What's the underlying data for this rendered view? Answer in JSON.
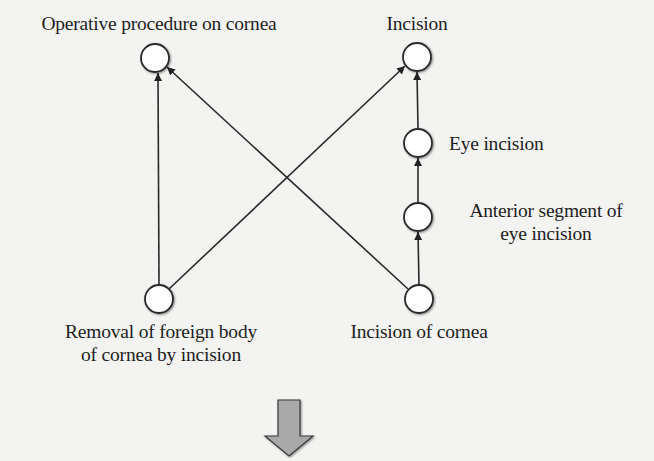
{
  "diagram": {
    "type": "directed-graph",
    "nodes": [
      {
        "id": "operative_procedure_on_cornea",
        "label": "Operative procedure on cornea",
        "lines": [
          "Operative procedure on cornea"
        ],
        "cx": 155,
        "cy": 58
      },
      {
        "id": "incision",
        "label": "Incision",
        "lines": [
          "Incision"
        ],
        "cx": 417,
        "cy": 57
      },
      {
        "id": "eye_incision",
        "label": "Eye incision",
        "lines": [
          "Eye incision"
        ],
        "cx": 418,
        "cy": 143
      },
      {
        "id": "anterior_segment_of_eye_incision",
        "label": "Anterior segment of eye incision",
        "lines": [
          "Anterior segment of",
          "eye incision"
        ],
        "cx": 418,
        "cy": 217
      },
      {
        "id": "removal_of_foreign_body",
        "label": "Removal of foreign body of cornea by incision",
        "lines": [
          "Removal of foreign body",
          "of cornea by incision"
        ],
        "cx": 159,
        "cy": 299
      },
      {
        "id": "incision_of_cornea",
        "label": "Incision of cornea",
        "lines": [
          "Incision of cornea"
        ],
        "cx": 419,
        "cy": 299
      }
    ],
    "edges": [
      {
        "from": "removal_of_foreign_body",
        "to": "operative_procedure_on_cornea"
      },
      {
        "from": "removal_of_foreign_body",
        "to": "incision"
      },
      {
        "from": "incision_of_cornea",
        "to": "operative_procedure_on_cornea"
      },
      {
        "from": "incision_of_cornea",
        "to": "anterior_segment_of_eye_incision"
      },
      {
        "from": "anterior_segment_of_eye_incision",
        "to": "eye_incision"
      },
      {
        "from": "eye_incision",
        "to": "incision"
      }
    ],
    "node_radius": 14,
    "colors": {
      "background": "#f3f3f1",
      "node_fill": "#ffffff",
      "stroke": "#2a2a2a",
      "down_arrow_fill": "#a9a9a9",
      "down_arrow_stroke": "#3a3a3a"
    }
  },
  "labels": {
    "operative_procedure_on_cornea": "Operative procedure on cornea",
    "incision": "Incision",
    "eye_incision": "Eye incision",
    "anterior_line1": "Anterior segment of",
    "anterior_line2": "eye incision",
    "removal_line1": "Removal of foreign body",
    "removal_line2": "of cornea by incision",
    "incision_of_cornea": "Incision of cornea"
  },
  "down_arrow": {
    "semantic": "transformation-arrow",
    "direction": "down"
  }
}
